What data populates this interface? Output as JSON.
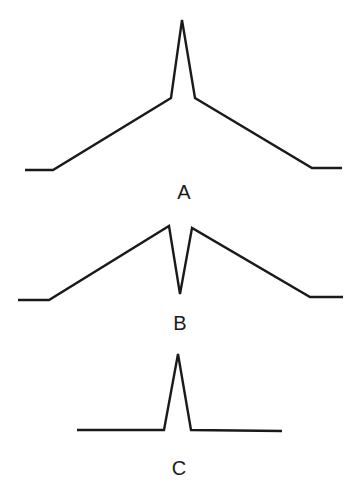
{
  "figure": {
    "panels": [
      {
        "id": "A",
        "label": "A",
        "description": "Broad triangular hump with a sharp narrow peak on top",
        "points": [
          [
            25,
            170
          ],
          [
            53,
            170
          ],
          [
            171,
            98
          ],
          [
            182,
            20
          ],
          [
            195,
            98
          ],
          [
            312,
            168
          ],
          [
            342,
            168
          ]
        ],
        "label_pos": [
          184,
          199
        ]
      },
      {
        "id": "B",
        "label": "B",
        "description": "Broad triangular hump with a sharp narrow dip at the center",
        "points": [
          [
            18,
            300
          ],
          [
            49,
            300
          ],
          [
            169,
            226
          ],
          [
            180,
            294
          ],
          [
            192,
            228
          ],
          [
            310,
            297
          ],
          [
            343,
            297
          ]
        ],
        "label_pos": [
          180,
          330
        ]
      },
      {
        "id": "C",
        "label": "C",
        "description": "Flat baseline with a single sharp narrow peak",
        "points": [
          [
            77,
            430
          ],
          [
            164,
            430
          ],
          [
            178,
            354
          ],
          [
            191,
            430
          ],
          [
            282,
            431
          ]
        ],
        "label_pos": [
          179,
          475
        ]
      }
    ],
    "stroke_color": "#1a1a1a",
    "background": "#ffffff"
  }
}
